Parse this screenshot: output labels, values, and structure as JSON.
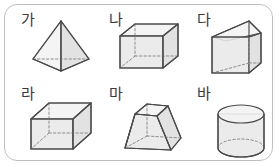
{
  "figure": {
    "title": "",
    "kind": "geometric-solids-chart",
    "frame": {
      "border_color": "#bfbfbf",
      "background": "#ffffff",
      "corner_radius": 13
    },
    "style": {
      "face_fill": "#e8e8e8",
      "edge_color": "#4a4a4a",
      "hidden_edge_color": "#8d8d8d",
      "hidden_edge_style": "dashed",
      "label_color": "#3a3a3a"
    },
    "rows": 2,
    "columns": 3
  },
  "items": [
    {
      "label": "가",
      "shape_name": "square-pyramid",
      "shape_description": "각뿔 (square pyramid) with apex on top and dashed hidden base edges",
      "row": 1,
      "column": 1,
      "faces": 5,
      "edges": 8,
      "vertices": 5
    },
    {
      "label": "나",
      "shape_name": "rectangular-prism",
      "shape_description": "직육면체 (cuboid / rectangular prism) lying on its long side",
      "row": 1,
      "column": 2,
      "faces": 6,
      "edges": 12,
      "vertices": 8
    },
    {
      "label": "다",
      "shape_name": "triangular-prism",
      "shape_description": "삼각기둥 (triangular prism) standing upright",
      "row": 1,
      "column": 3,
      "faces": 5,
      "edges": 9,
      "vertices": 6
    },
    {
      "label": "라",
      "shape_name": "cube",
      "shape_description": "정육면체 (cube) drawn in oblique projection",
      "row": 2,
      "column": 1,
      "faces": 6,
      "edges": 12,
      "vertices": 8
    },
    {
      "label": "마",
      "shape_name": "truncated-pyramid",
      "shape_description": "각뿔대 (frustum of a square pyramid)",
      "row": 2,
      "column": 2,
      "faces": 6,
      "edges": 12,
      "vertices": 8
    },
    {
      "label": "바",
      "shape_name": "cylinder",
      "shape_description": "원기둥 (cylinder) with dashed hidden bottom ellipse",
      "row": 2,
      "column": 3,
      "faces": 3,
      "edges": 2,
      "vertices": 0
    }
  ]
}
